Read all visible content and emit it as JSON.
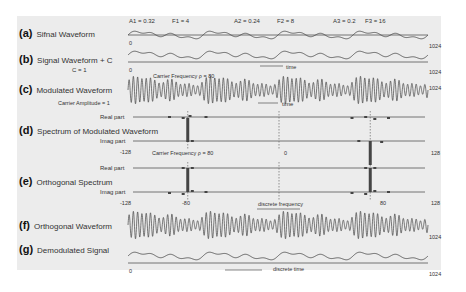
{
  "params": {
    "a1": "A1 = 0.32",
    "f1": "F1 = 4",
    "a2": "A2 = 0.24",
    "f2": "F2 = 8",
    "a3": "A3 = 0.2",
    "f3": "F3 = 16"
  },
  "rows": {
    "a": {
      "tag": "(a)",
      "label": "Sifnal Waveform"
    },
    "b": {
      "tag": "(b)",
      "label": "Signal Waveform + C",
      "sub": "C = 1"
    },
    "c": {
      "tag": "(c)",
      "label": "Modulated Waveform",
      "sub": "Carrier Amplitude = 1",
      "carrier": "Carrier Frequency  ρ = 80"
    },
    "d": {
      "tag": "(d)",
      "label": "Spectrum of Modulated Waveform",
      "real": "Real part",
      "imag": "Imag part"
    },
    "e": {
      "tag": "(e)",
      "label": "Orthogonal Spectrum",
      "real": "Real part",
      "imag": "Imag part",
      "carrier": "Carrier Frequency  ρ = 80"
    },
    "f": {
      "tag": "(f)",
      "label": "Orthogonal Waveform"
    },
    "g": {
      "tag": "(g)",
      "label": "Demodulated Signal"
    }
  },
  "axes": {
    "zero": "0",
    "end": "1024",
    "time": "time",
    "discrete_time": "discrete time",
    "discrete_frequency": "discrete frequency",
    "freq_min": "-128",
    "freq_neg_carrier": "-80",
    "freq_zero": "0",
    "freq_pos_carrier": "80",
    "freq_max": "128"
  },
  "signal": {
    "components": [
      {
        "amplitude": 0.32,
        "frequency": 4
      },
      {
        "amplitude": 0.24,
        "frequency": 8
      },
      {
        "amplitude": 0.2,
        "frequency": 16
      }
    ],
    "offset_c": 1,
    "carrier_frequency": 80,
    "carrier_amplitude": 1,
    "samples": 1024
  },
  "colors": {
    "panel": "#ececec",
    "line": "#444444",
    "axis": "#555555"
  }
}
